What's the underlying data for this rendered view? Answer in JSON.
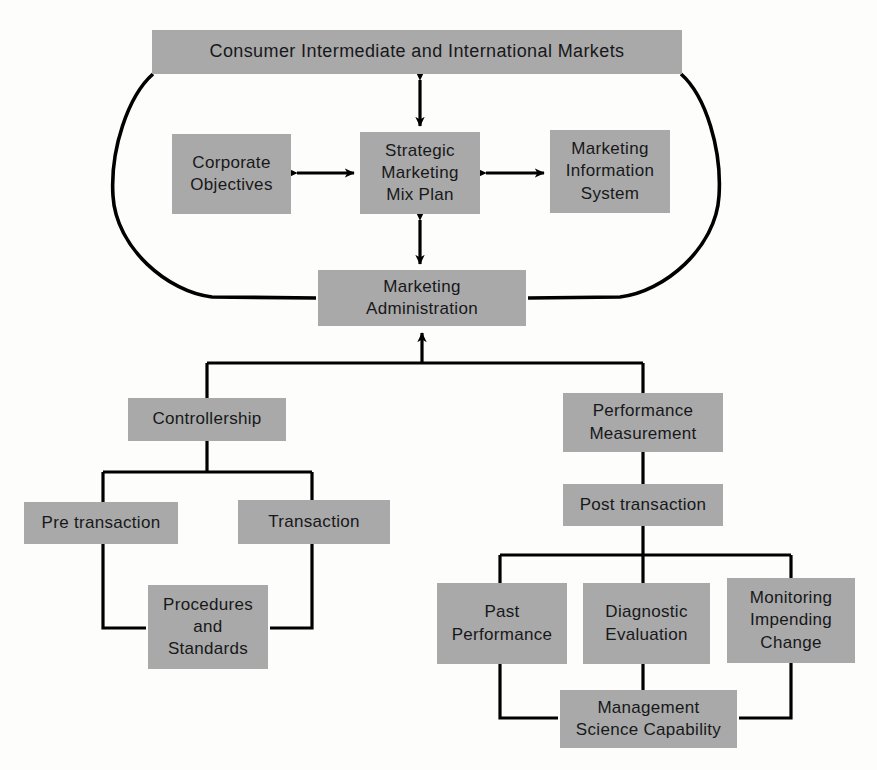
{
  "diagram": {
    "type": "hierarchy-flowchart",
    "colors": {
      "node_fill": "#a9a9a9",
      "node_text": "#17181a",
      "connector": "#000000",
      "background": "#fdfdfb"
    },
    "nodes": [
      {
        "id": "consumer-markets",
        "name": "consumer-intermediate-international-markets",
        "lines": [
          "Consumer Intermediate and International Markets"
        ],
        "x": 152,
        "y": 30,
        "w": 530,
        "h": 44
      },
      {
        "id": "corporate-objectives",
        "name": "corporate-objectives",
        "lines": [
          "Corporate",
          "Objectives"
        ],
        "x": 172,
        "y": 134,
        "w": 119,
        "h": 80
      },
      {
        "id": "strategic-marketing-mix-plan",
        "name": "strategic-marketing-mix-plan",
        "lines": [
          "Strategic",
          "Marketing",
          "Mix Plan"
        ],
        "x": 360,
        "y": 132,
        "w": 120,
        "h": 82
      },
      {
        "id": "marketing-information-system",
        "name": "marketing-information-system",
        "lines": [
          "Marketing",
          "Information",
          "System"
        ],
        "x": 550,
        "y": 130,
        "w": 120,
        "h": 83
      },
      {
        "id": "marketing-administration",
        "name": "marketing-administration",
        "lines": [
          "Marketing",
          "Administration"
        ],
        "x": 318,
        "y": 270,
        "w": 208,
        "h": 56
      },
      {
        "id": "controllership",
        "name": "controllership",
        "lines": [
          "Controllership"
        ],
        "x": 128,
        "y": 398,
        "w": 158,
        "h": 43
      },
      {
        "id": "performance-measurement",
        "name": "performance-measurement",
        "lines": [
          "Performance",
          "Measurement"
        ],
        "x": 563,
        "y": 393,
        "w": 160,
        "h": 59
      },
      {
        "id": "pre-transaction",
        "name": "pre-transaction",
        "lines": [
          "Pre  transaction"
        ],
        "x": 24,
        "y": 502,
        "w": 154,
        "h": 42
      },
      {
        "id": "transaction",
        "name": "transaction",
        "lines": [
          "Transaction"
        ],
        "x": 238,
        "y": 500,
        "w": 152,
        "h": 44
      },
      {
        "id": "post-transaction",
        "name": "post-transaction",
        "lines": [
          "Post  transaction"
        ],
        "x": 563,
        "y": 484,
        "w": 160,
        "h": 42
      },
      {
        "id": "procedures-and-standards",
        "name": "procedures-and-standards",
        "lines": [
          "Procedures",
          "and",
          "Standards"
        ],
        "x": 148,
        "y": 585,
        "w": 120,
        "h": 84
      },
      {
        "id": "past-performance",
        "name": "past-performance",
        "lines": [
          "Past",
          "Performance"
        ],
        "x": 437,
        "y": 583,
        "w": 130,
        "h": 81
      },
      {
        "id": "diagnostic-evaluation",
        "name": "diagnostic-evaluation",
        "lines": [
          "Diagnostic",
          "Evaluation"
        ],
        "x": 583,
        "y": 583,
        "w": 127,
        "h": 81
      },
      {
        "id": "monitoring-impending-change",
        "name": "monitoring-impending-change",
        "lines": [
          "Monitoring",
          "Impending",
          "Change"
        ],
        "x": 727,
        "y": 578,
        "w": 128,
        "h": 85
      },
      {
        "id": "management-science-capability",
        "name": "management-science-capability",
        "lines": [
          "Management",
          "Science Capability"
        ],
        "x": 560,
        "y": 690,
        "w": 177,
        "h": 58
      }
    ],
    "connectors": [
      {
        "name": "consumer-to-strategic",
        "kind": "double-arrow-vertical"
      },
      {
        "name": "corporate-to-strategic",
        "kind": "double-arrow-horizontal"
      },
      {
        "name": "strategic-to-mis",
        "kind": "double-arrow-horizontal"
      },
      {
        "name": "strategic-to-administration",
        "kind": "double-arrow-vertical"
      },
      {
        "name": "markets-left-arc-to-administration",
        "kind": "curve"
      },
      {
        "name": "markets-right-arc-to-administration",
        "kind": "curve"
      },
      {
        "name": "administration-to-branch-bus",
        "kind": "tree-bus"
      },
      {
        "name": "controllership-branch-bus",
        "kind": "tree-bus"
      },
      {
        "name": "pre-transaction-to-procedures",
        "kind": "elbow"
      },
      {
        "name": "transaction-to-procedures",
        "kind": "elbow"
      },
      {
        "name": "performance-to-post-transaction",
        "kind": "straight"
      },
      {
        "name": "post-transaction-branch-bus",
        "kind": "tree-bus"
      },
      {
        "name": "past-performance-to-management-science",
        "kind": "elbow"
      },
      {
        "name": "diagnostic-to-management-science",
        "kind": "straight"
      },
      {
        "name": "monitoring-to-management-science",
        "kind": "elbow"
      }
    ]
  }
}
